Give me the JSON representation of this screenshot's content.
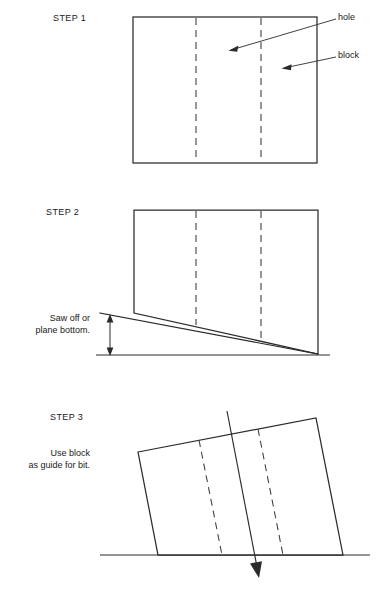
{
  "figure": {
    "line_color": "#2b2b2b",
    "background": "#ffffff"
  },
  "steps": [
    {
      "id": "step1",
      "label": "STEP 1",
      "note": "",
      "block": {
        "shape": "rectangle",
        "left": 133,
        "top": 17,
        "right": 317,
        "bottom": 163
      },
      "hole_lines": [
        {
          "x": 196,
          "y1": 17,
          "y2": 163
        },
        {
          "x": 261,
          "y1": 17,
          "y2": 163
        }
      ],
      "callouts": [
        {
          "label": "hole",
          "text_x": 338,
          "text_y": 18,
          "leader_from_x": 336,
          "leader_from_y": 19,
          "leader_to_x": 230,
          "leader_to_y": 50
        },
        {
          "label": "block",
          "text_x": 338,
          "text_y": 56,
          "leader_from_x": 336,
          "leader_from_y": 57,
          "leader_to_x": 283,
          "leader_to_y": 68
        }
      ]
    },
    {
      "id": "step2",
      "label": "STEP 2",
      "note": "Saw off or\nplane bottom.",
      "note_line1": "Saw off or",
      "note_line2": "plane bottom.",
      "block": {
        "shape": "rectangle",
        "left": 134,
        "top": 210,
        "right": 318,
        "bottom": 355
      },
      "cut_line": {
        "x1": 100,
        "y1": 313,
        "x2": 318,
        "y2": 354
      },
      "ground_line": {
        "x1": 96,
        "y1": 355,
        "x2": 330,
        "y2": 355
      },
      "dimension_arrow": {
        "x": 110,
        "y_top": 316,
        "y_bottom": 354
      },
      "hole_lines": [
        {
          "x": 196,
          "y1": 210,
          "y2": 330
        },
        {
          "x": 261,
          "y1": 210,
          "y2": 343
        }
      ]
    },
    {
      "id": "step3",
      "label": "STEP 3",
      "note": "Use block\nas guide for bit.",
      "note_line1": "Use block",
      "note_line2": "as guide for bit.",
      "block": {
        "shape": "tilted-quad",
        "corners": [
          {
            "x": 138,
            "y": 452
          },
          {
            "x": 316,
            "y": 418
          },
          {
            "x": 343,
            "y": 555
          },
          {
            "x": 158,
            "y": 555
          }
        ]
      },
      "hole_lines": [
        {
          "x1": 199,
          "y1": 440,
          "x2": 222,
          "y2": 555
        },
        {
          "x1": 258,
          "y1": 429,
          "x2": 283,
          "y2": 555
        }
      ],
      "ground_line": {
        "x1": 100,
        "y1": 555,
        "x2": 370,
        "y2": 555
      },
      "bit_line": {
        "x1": 227,
        "y1": 411,
        "x2": 258,
        "y2": 572
      },
      "bit_arrow_tip": {
        "x": 259,
        "y": 578
      }
    }
  ]
}
